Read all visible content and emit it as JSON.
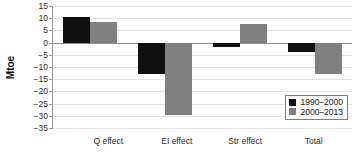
{
  "chart_data": {
    "type": "bar",
    "title": "",
    "subtitle": "",
    "xlabel": "",
    "ylabel": "Mtoe",
    "categories": [
      "Q effect",
      "EI effect",
      "Str effect",
      "Total"
    ],
    "series": [
      {
        "name": "1990–2000",
        "color": "#101010",
        "values": [
          10.3,
          -12.7,
          -1.7,
          -4.0
        ]
      },
      {
        "name": "2000–2013",
        "color": "#808080",
        "values": [
          8.5,
          -29.5,
          7.8,
          -12.8
        ]
      }
    ],
    "ylim": [
      -35,
      15
    ],
    "ytick_step": 5,
    "ytick_labels": [
      "15",
      "10",
      "5",
      "0",
      "−5",
      "−10",
      "−15",
      "−20",
      "−25",
      "−30",
      "−35"
    ],
    "ytick_values": [
      15,
      10,
      5,
      0,
      -5,
      -10,
      -15,
      -20,
      -25,
      -30,
      -35
    ],
    "grid": true,
    "grid_axis": "y",
    "legend_position": "bottom-right",
    "legend_entries": [
      {
        "label": "1990–2000",
        "swatch": "black"
      },
      {
        "label": "2000–2013",
        "swatch": "gray"
      }
    ],
    "colors": {
      "series_1990_2000": "#101010",
      "series_2000_2013": "#808080",
      "gridline": "#e2e2e2",
      "axis": "#9a9a9a",
      "zero_line": "#8a8a8a",
      "text": "#2b2b2b",
      "background": "#ffffff"
    }
  }
}
